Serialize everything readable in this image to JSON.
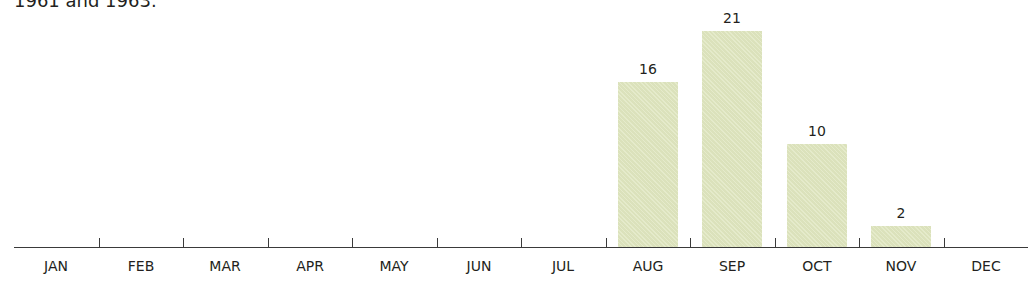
{
  "caption": "1961 and 1963.",
  "colors": {
    "bar": "#dfe6bf",
    "axis": "#3a3a3a",
    "text": "#231f20"
  },
  "chart_data": {
    "type": "bar",
    "title": "",
    "xlabel": "",
    "ylabel": "",
    "categories": [
      "JAN",
      "FEB",
      "MAR",
      "APR",
      "MAY",
      "JUN",
      "JUL",
      "AUG",
      "SEP",
      "OCT",
      "NOV",
      "DEC"
    ],
    "values": [
      0,
      0,
      0,
      0,
      0,
      0,
      0,
      16,
      21,
      10,
      2,
      0
    ],
    "data_labels": [
      "",
      "",
      "",
      "",
      "",
      "",
      "",
      "16",
      "21",
      "10",
      "2",
      ""
    ],
    "ylim": [
      0,
      21
    ],
    "grid": false,
    "legend": null
  }
}
